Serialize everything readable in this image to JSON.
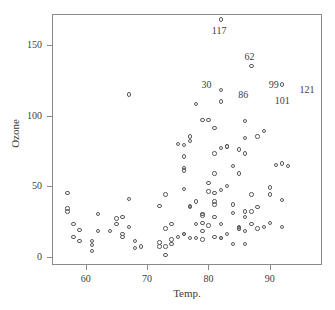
{
  "chart_data": {
    "type": "scatter",
    "title": "",
    "xlabel": "Temp.",
    "ylabel": "Ozone",
    "xlim": [
      54.5,
      98.5
    ],
    "ylim": [
      -6,
      172
    ],
    "xticks": [
      60,
      70,
      80,
      90
    ],
    "yticks": [
      0,
      50,
      100,
      150
    ],
    "grid": false,
    "legend": null,
    "marker": "open-circle",
    "marker_color": "#5a5a5a",
    "axis_color": "#8a8a8a",
    "text_color": "#3d3d3d",
    "background": "#ffffff",
    "series": [
      {
        "name": "Ozone vs Temp.",
        "points": [
          [
            67,
            41
          ],
          [
            72,
            36
          ],
          [
            74,
            12
          ],
          [
            62,
            18
          ],
          [
            66,
            28
          ],
          [
            65,
            23
          ],
          [
            59,
            19
          ],
          [
            61,
            8
          ],
          [
            69,
            7
          ],
          [
            66,
            16
          ],
          [
            68,
            11
          ],
          [
            58,
            14
          ],
          [
            64,
            18
          ],
          [
            66,
            14
          ],
          [
            57,
            34
          ],
          [
            68,
            6
          ],
          [
            62,
            30
          ],
          [
            59,
            11
          ],
          [
            73,
            1
          ],
          [
            61,
            11
          ],
          [
            61,
            4
          ],
          [
            57,
            32
          ],
          [
            58,
            23
          ],
          [
            57,
            45
          ],
          [
            67,
            115
          ],
          [
            81,
            37
          ],
          [
            79,
            29
          ],
          [
            76,
            71
          ],
          [
            78,
            39
          ],
          [
            74,
            23
          ],
          [
            67,
            21
          ],
          [
            84,
            37
          ],
          [
            85,
            20
          ],
          [
            79,
            12
          ],
          [
            82,
            13
          ],
          [
            87,
            135
          ],
          [
            90,
            49
          ],
          [
            87,
            32
          ],
          [
            93,
            64
          ],
          [
            92,
            40
          ],
          [
            82,
            77
          ],
          [
            80,
            97
          ],
          [
            79,
            97
          ],
          [
            77,
            85
          ],
          [
            72,
            10
          ],
          [
            65,
            27
          ],
          [
            73,
            7
          ],
          [
            76,
            48
          ],
          [
            77,
            35
          ],
          [
            76,
            61
          ],
          [
            76,
            79
          ],
          [
            76,
            63
          ],
          [
            76,
            16
          ],
          [
            75,
            80
          ],
          [
            78,
            108
          ],
          [
            73,
            20
          ],
          [
            80,
            52
          ],
          [
            77,
            82
          ],
          [
            83,
            50
          ],
          [
            84,
            64
          ],
          [
            85,
            59
          ],
          [
            81,
            39
          ],
          [
            84,
            9
          ],
          [
            83,
            16
          ],
          [
            83,
            78
          ],
          [
            88,
            35
          ],
          [
            92,
            66
          ],
          [
            92,
            122
          ],
          [
            89,
            89
          ],
          [
            82,
            110
          ],
          [
            73,
            44
          ],
          [
            81,
            28
          ],
          [
            91,
            65
          ],
          [
            80,
            22
          ],
          [
            81,
            59
          ],
          [
            82,
            23
          ],
          [
            84,
            31
          ],
          [
            87,
            44
          ],
          [
            85,
            21
          ],
          [
            74,
            9
          ],
          [
            81,
            45
          ],
          [
            82,
            168
          ],
          [
            86,
            73
          ],
          [
            85,
            76
          ],
          [
            82,
            118
          ],
          [
            86,
            84
          ],
          [
            88,
            85
          ],
          [
            86,
            96
          ],
          [
            83,
            78
          ],
          [
            81,
            73
          ],
          [
            81,
            91
          ],
          [
            82,
            47
          ],
          [
            86,
            32
          ],
          [
            85,
            20
          ],
          [
            87,
            23
          ],
          [
            89,
            21
          ],
          [
            90,
            24
          ],
          [
            90,
            44
          ],
          [
            92,
            21
          ],
          [
            86,
            28
          ],
          [
            86,
            9
          ],
          [
            82,
            13
          ],
          [
            80,
            46
          ],
          [
            79,
            18
          ],
          [
            77,
            13
          ],
          [
            79,
            24
          ],
          [
            76,
            16
          ],
          [
            78,
            13
          ],
          [
            78,
            23
          ],
          [
            77,
            36
          ],
          [
            72,
            7
          ],
          [
            75,
            14
          ],
          [
            79,
            30
          ],
          [
            81,
            14
          ],
          [
            86,
            18
          ],
          [
            88,
            20
          ]
        ]
      }
    ],
    "outlier_labels": [
      {
        "text": "117",
        "x": 82,
        "y": 168,
        "position": "below"
      },
      {
        "text": "62",
        "x": 87,
        "y": 135,
        "position": "above"
      },
      {
        "text": "30",
        "x": 80,
        "y": 115,
        "position": "above"
      },
      {
        "text": "86",
        "x": 86,
        "y": 108,
        "position": "above"
      },
      {
        "text": "99",
        "x": 89,
        "y": 122,
        "position": "right"
      },
      {
        "text": "121",
        "x": 94,
        "y": 118,
        "position": "right"
      },
      {
        "text": "101",
        "x": 90,
        "y": 110,
        "position": "right"
      }
    ]
  },
  "figure": {
    "xlabel": "Temp.",
    "ylabel": "Ozone",
    "xtick_labels": [
      "60",
      "70",
      "80",
      "90"
    ],
    "ytick_labels": [
      "0",
      "50",
      "100",
      "150"
    ]
  }
}
